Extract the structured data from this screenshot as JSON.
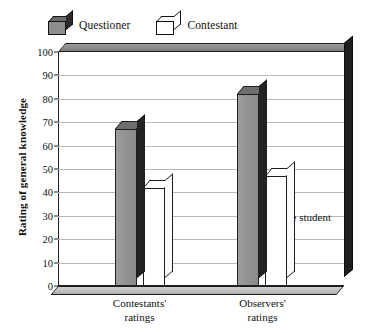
{
  "chart_data": {
    "type": "bar",
    "title": "",
    "subtitle": "",
    "xlabel": "",
    "ylabel": "Rating of general knowledge",
    "categories": [
      "Contestants' ratings",
      "Observers' ratings"
    ],
    "category_lines": [
      [
        "Contestants'",
        "ratings"
      ],
      [
        "Observers'",
        "ratings"
      ]
    ],
    "series": [
      {
        "name": "Questioner",
        "values": [
          67,
          82
        ],
        "color": "#909090"
      },
      {
        "name": "Contestant",
        "values": [
          42,
          47
        ],
        "color": "#ffffff"
      }
    ],
    "ylim": [
      0,
      100
    ],
    "ytick_step": 10,
    "yticks": [
      0,
      10,
      20,
      30,
      40,
      50,
      60,
      70,
      80,
      90,
      100
    ],
    "ytick_labels": [
      "0",
      "10",
      "20",
      "30",
      "40",
      "50",
      "60",
      "70",
      "80",
      "90",
      "100"
    ],
    "grid": true,
    "grid_axis": "y",
    "legend_position": "top-left",
    "style": "3d-grayscale",
    "annotations": [
      {
        "text": "Average student",
        "value": 50,
        "position": "upper-right"
      }
    ]
  },
  "legend": {
    "entries": [
      {
        "label": "Questioner",
        "swatch": "dark-cube-icon"
      },
      {
        "label": "Contestant",
        "swatch": "light-cube-icon"
      }
    ]
  },
  "annotation": {
    "average_student": "Average student"
  }
}
